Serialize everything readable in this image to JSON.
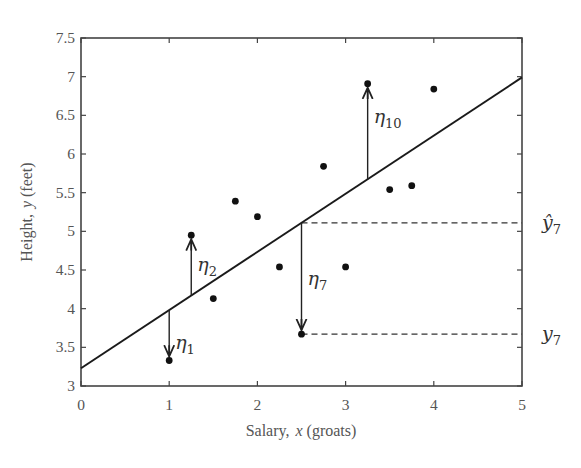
{
  "chart_data": {
    "type": "scatter",
    "title": "",
    "xlabel": "Salary,",
    "xlabel_var": "x",
    "xlabel_unit": "(groats)",
    "ylabel": "Height,",
    "ylabel_var": "y",
    "ylabel_unit": "(feet)",
    "xlim": [
      0,
      5
    ],
    "ylim": [
      3,
      7.5
    ],
    "xticks": [
      0,
      1,
      2,
      3,
      4,
      5
    ],
    "xtick_labels": [
      "0",
      "1",
      "2",
      "3",
      "4",
      "5"
    ],
    "yticks": [
      3,
      3.5,
      4,
      4.5,
      5,
      5.5,
      6,
      6.5,
      7,
      7.5
    ],
    "ytick_labels": [
      "3",
      "3.5",
      "4",
      "4.5",
      "5",
      "5.5",
      "6",
      "6.5",
      "7",
      "7.5"
    ],
    "grid": false,
    "legend": "none",
    "points": {
      "x": [
        1.0,
        1.25,
        1.5,
        1.75,
        2.0,
        2.25,
        2.5,
        2.75,
        3.0,
        3.25,
        3.5,
        3.75,
        4.0
      ],
      "y": [
        3.33,
        4.95,
        4.13,
        5.39,
        5.19,
        4.54,
        3.67,
        5.84,
        4.54,
        6.91,
        5.54,
        5.59,
        6.84
      ]
    },
    "regression_line": {
      "intercept": 3.23,
      "slope": 0.752,
      "x_range": [
        0,
        5
      ]
    },
    "residuals": [
      {
        "label": "η",
        "sub": "1",
        "point_index": 0
      },
      {
        "label": "η",
        "sub": "2",
        "point_index": 1
      },
      {
        "label": "η",
        "sub": "7",
        "point_index": 6
      },
      {
        "label": "η",
        "sub": "10",
        "point_index": 9
      }
    ],
    "annotations": [
      {
        "label": "ŷ",
        "sub": "7",
        "refers_to": "fitted value at point 7 (dashed line to right axis)"
      },
      {
        "label": "y",
        "sub": "7",
        "refers_to": "observed value of point 7 (dashed line to right axis)"
      }
    ]
  }
}
